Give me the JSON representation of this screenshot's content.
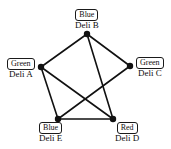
{
  "figure": {
    "background_color": "#ffffff",
    "edge_color": "#111111",
    "node_fill_color": "#111111",
    "width": 171,
    "height": 149
  },
  "nodes": [
    {
      "id": "B",
      "label": "Deli B",
      "color_label": "Blue",
      "x": 87,
      "y": 34,
      "label_pos": "top"
    },
    {
      "id": "A",
      "label": "Deli A",
      "color_label": "Green",
      "x": 41,
      "y": 67,
      "label_pos": "left"
    },
    {
      "id": "C",
      "label": "Deli C",
      "color_label": "Green",
      "x": 130,
      "y": 66,
      "label_pos": "right"
    },
    {
      "id": "E",
      "label": "Deli E",
      "color_label": "Blue",
      "x": 58,
      "y": 119,
      "label_pos": "bottom-left"
    },
    {
      "id": "D",
      "label": "Deli D",
      "color_label": "Red",
      "x": 113,
      "y": 119,
      "label_pos": "bottom-right"
    }
  ],
  "edges": [
    {
      "from": "A",
      "to": "B"
    },
    {
      "from": "B",
      "to": "C"
    },
    {
      "from": "B",
      "to": "D"
    },
    {
      "from": "A",
      "to": "D"
    },
    {
      "from": "A",
      "to": "E"
    },
    {
      "from": "C",
      "to": "E"
    },
    {
      "from": "D",
      "to": "E"
    }
  ]
}
